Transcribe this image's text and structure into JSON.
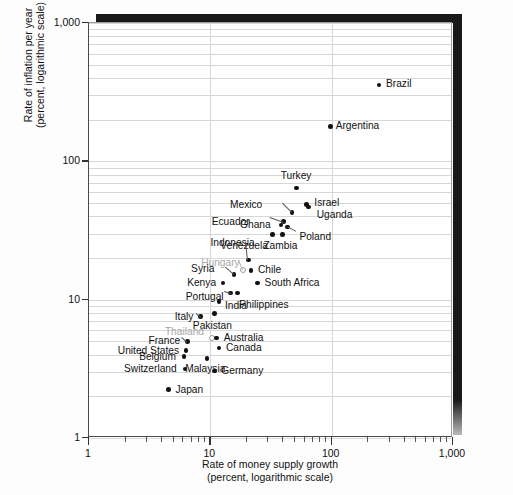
{
  "chart_data": {
    "type": "scatter",
    "title": "",
    "xlabel": "Rate of money supply growth\n(percent, logarithmic scale)",
    "ylabel": "Rate of inflation per year\n(percent, logarithmic scale)",
    "xscale": "log",
    "yscale": "log",
    "xlim": [
      1,
      1000
    ],
    "ylim": [
      1,
      1000
    ],
    "xticks": [
      "1",
      "10",
      "100",
      "1,000"
    ],
    "yticks": [
      "1",
      "10",
      "100",
      "1,000"
    ],
    "grid": "minor horizontal, major vertical",
    "legend": "none",
    "points": [
      {
        "name": "Brazil",
        "x": 250,
        "y": 350,
        "style": "solid"
      },
      {
        "name": "Argentina",
        "x": 100,
        "y": 175,
        "style": "solid"
      },
      {
        "name": "Turkey",
        "x": 52,
        "y": 63,
        "style": "solid"
      },
      {
        "name": "Israel",
        "x": 63,
        "y": 48,
        "style": "solid"
      },
      {
        "name": "Uganda",
        "x": 66,
        "y": 46,
        "style": "solid"
      },
      {
        "name": "Mexico",
        "x": 48,
        "y": 42,
        "style": "solid"
      },
      {
        "name": "Ecuador",
        "x": 41,
        "y": 36,
        "style": "solid"
      },
      {
        "name": "Poland",
        "x": 44,
        "y": 33,
        "style": "solid"
      },
      {
        "name": "Ghana",
        "x": 39,
        "y": 34,
        "style": "solid"
      },
      {
        "name": "Venezuela",
        "x": 33,
        "y": 29,
        "style": "solid"
      },
      {
        "name": "Zambia",
        "x": 40,
        "y": 29,
        "style": "solid"
      },
      {
        "name": "Indonesia",
        "x": 21,
        "y": 19,
        "style": "solid"
      },
      {
        "name": "Hungary",
        "x": 19,
        "y": 16,
        "style": "hollow"
      },
      {
        "name": "Chile",
        "x": 22,
        "y": 16,
        "style": "solid"
      },
      {
        "name": "Syria",
        "x": 16,
        "y": 15,
        "style": "solid"
      },
      {
        "name": "South Africa",
        "x": 25,
        "y": 13,
        "style": "solid"
      },
      {
        "name": "Kenya",
        "x": 13,
        "y": 13,
        "style": "solid"
      },
      {
        "name": "Portugal",
        "x": 15,
        "y": 11,
        "style": "solid"
      },
      {
        "name": "Philippines",
        "x": 17,
        "y": 11,
        "style": "solid"
      },
      {
        "name": "India",
        "x": 12,
        "y": 9.5,
        "style": "solid"
      },
      {
        "name": "Pakistan",
        "x": 11,
        "y": 7.8,
        "style": "solid"
      },
      {
        "name": "Italy",
        "x": 8.5,
        "y": 7.4,
        "style": "solid"
      },
      {
        "name": "Thailand",
        "x": 10.5,
        "y": 5.2,
        "style": "hollow"
      },
      {
        "name": "Australia",
        "x": 11.5,
        "y": 5.2,
        "style": "solid"
      },
      {
        "name": "France",
        "x": 6.6,
        "y": 4.9,
        "style": "solid"
      },
      {
        "name": "Canada",
        "x": 12,
        "y": 4.4,
        "style": "solid"
      },
      {
        "name": "United States",
        "x": 6.4,
        "y": 4.2,
        "style": "solid"
      },
      {
        "name": "Belgium",
        "x": 6.2,
        "y": 3.8,
        "style": "solid"
      },
      {
        "name": "Malaysia",
        "x": 9.6,
        "y": 3.7,
        "style": "solid"
      },
      {
        "name": "Switzerland",
        "x": 6.3,
        "y": 3.1,
        "style": "solid"
      },
      {
        "name": "Germany",
        "x": 11,
        "y": 3.0,
        "style": "solid"
      },
      {
        "name": "Japan",
        "x": 4.6,
        "y": 2.2,
        "style": "solid"
      }
    ]
  },
  "axes": {
    "y_title": "Rate of inflation per year\n(percent, logarithmic scale)",
    "x_title": "Rate of money supply growth\n(percent, logarithmic scale)",
    "y_tick_labels": [
      "1,000",
      "100",
      "10",
      "1"
    ],
    "x_tick_labels": [
      "1",
      "10",
      "100",
      "1,000"
    ]
  },
  "labels": {
    "brazil": "Brazil",
    "argentina": "Argentina",
    "turkey": "Turkey",
    "israel": "Israel",
    "uganda": "Uganda",
    "mexico": "Mexico",
    "ecuador": "Ecuador",
    "poland": "Poland",
    "ghana": "Ghana",
    "venezuela": "Venezuela",
    "zambia": "Zambia",
    "indonesia": "Indonesia",
    "hungary": "Hungary",
    "chile": "Chile",
    "syria": "Syria",
    "south_africa": "South Africa",
    "kenya": "Kenya",
    "portugal": "Portugal",
    "philippines": "Philippines",
    "india": "India",
    "pakistan": "Pakistan",
    "italy": "Italy",
    "thailand": "Thailand",
    "australia": "Australia",
    "france": "France",
    "canada": "Canada",
    "united_states": "United States",
    "belgium": "Belgium",
    "malaysia": "Malaysia",
    "switzerland": "Switzerland",
    "germany": "Germany",
    "japan": "Japan"
  }
}
